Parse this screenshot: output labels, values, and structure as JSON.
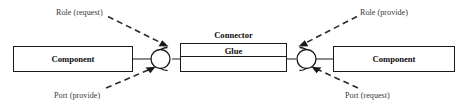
{
  "diagram": {
    "background_color": "#ffffff",
    "stroke_color": "#1a1a1a",
    "annotation_color": "#3d3a36"
  },
  "components": {
    "left": {
      "label": "Component"
    },
    "right": {
      "label": "Component"
    }
  },
  "connector": {
    "title_label": "Connector",
    "glue_label": "Glue"
  },
  "annotations": {
    "role_request": {
      "label": "Role (request)"
    },
    "role_provide": {
      "label": "Role (provide)"
    },
    "port_provide": {
      "label": "Port (provide)"
    },
    "port_request": {
      "label": "Port (request)"
    }
  }
}
